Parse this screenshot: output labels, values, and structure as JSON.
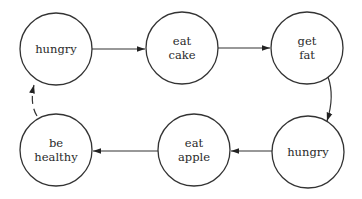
{
  "diagram": {
    "type": "state-cycle",
    "nodes": [
      {
        "id": "n1",
        "line1": "hungry",
        "line2": "",
        "cx": 56,
        "cy": 49
      },
      {
        "id": "n2",
        "line1": "eat",
        "line2": "cake",
        "cx": 182,
        "cy": 48
      },
      {
        "id": "n3",
        "line1": "get",
        "line2": "fat",
        "cx": 307,
        "cy": 48
      },
      {
        "id": "n4",
        "line1": "hungry",
        "line2": "",
        "cx": 308,
        "cy": 152
      },
      {
        "id": "n5",
        "line1": "eat",
        "line2": "apple",
        "cx": 194,
        "cy": 150
      },
      {
        "id": "n6",
        "line1": "be",
        "line2": "healthy",
        "cx": 56,
        "cy": 150
      }
    ],
    "edges": [
      {
        "from": "n1",
        "to": "n2",
        "style": "solid"
      },
      {
        "from": "n2",
        "to": "n3",
        "style": "solid"
      },
      {
        "from": "n3",
        "to": "n4",
        "style": "solid"
      },
      {
        "from": "n4",
        "to": "n5",
        "style": "solid"
      },
      {
        "from": "n5",
        "to": "n6",
        "style": "solid"
      },
      {
        "from": "n6",
        "to": "n1",
        "style": "dashed"
      }
    ],
    "colors": {
      "stroke": "#333333",
      "text": "#2a2a2a",
      "background": "#ffffff"
    }
  }
}
